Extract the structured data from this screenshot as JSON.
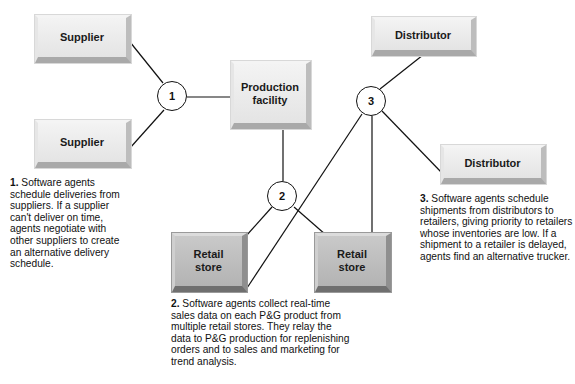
{
  "diagram": {
    "nodes": {
      "supplier_top": "Supplier",
      "supplier_bottom": "Supplier",
      "production": "Production facility",
      "distributor_top": "Distributor",
      "distributor_right": "Distributor",
      "retail_left": "Retail store",
      "retail_right": "Retail store"
    },
    "hubs": [
      "1",
      "2",
      "3"
    ],
    "notes": [
      {
        "number": "1.",
        "text": "Software agents schedule deliveries from suppliers. If a supplier can't deliver on time, agents negotiate with other suppliers to create an alternative delivery schedule."
      },
      {
        "number": "2.",
        "text": "Software agents collect real-time sales data on each P&G product from multiple retail stores. They relay the data to P&G production for replenishing orders and to sales and marketing for trend analysis."
      },
      {
        "number": "3.",
        "text": "Software agents schedule shipments from distributors to retailers, giving priority to retailers whose inventories are low. If a shipment to a retailer is delayed, agents find an alternative trucker."
      }
    ],
    "edges": [
      [
        "Supplier (top)",
        "1"
      ],
      [
        "Supplier (bottom)",
        "1"
      ],
      [
        "1",
        "Production facility"
      ],
      [
        "Production facility",
        "2"
      ],
      [
        "2",
        "Retail store (left)"
      ],
      [
        "2",
        "Retail store (right)"
      ],
      [
        "3",
        "Distributor (top)"
      ],
      [
        "3",
        "Distributor (right)"
      ],
      [
        "3",
        "Retail store (left)"
      ],
      [
        "3",
        "Retail store (right)"
      ]
    ]
  }
}
